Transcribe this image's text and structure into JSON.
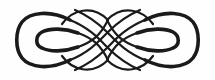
{
  "ornament": {
    "label": "Interlaced knot ornament",
    "stroke_color": "#1a1a1a",
    "background_color": "#fefefe"
  }
}
